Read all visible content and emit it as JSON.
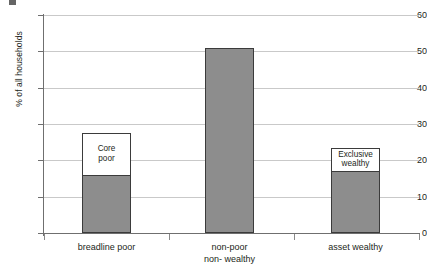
{
  "chart_data": {
    "type": "bar",
    "title": "",
    "subtitle": "",
    "xlabel": "",
    "ylabel": "% of all households",
    "ylim": [
      0,
      60
    ],
    "yticks": [
      0,
      10,
      20,
      30,
      40,
      50,
      60
    ],
    "ytick_labels": [
      "0",
      "10",
      "20",
      "30",
      "40",
      "50",
      "60"
    ],
    "grid": true,
    "legend": "none",
    "categories": [
      "breadline poor",
      "non-poor non- wealthy",
      "asset wealthy"
    ],
    "category_labels": [
      {
        "line1": "breadline poor",
        "line2": ""
      },
      {
        "line1": "non-poor",
        "line2": "non- wealthy"
      },
      {
        "line1": "asset wealthy",
        "line2": ""
      }
    ],
    "series": [
      {
        "name": "shaded portion",
        "values": [
          16,
          51,
          17
        ]
      },
      {
        "name": "total (outlined bar)",
        "values": [
          27.5,
          51,
          23.5
        ]
      }
    ],
    "values": [
      27.5,
      51,
      23.5
    ],
    "annotations": [
      {
        "category": "breadline poor",
        "line1": "Core",
        "line2": "poor",
        "from": 16,
        "to": 27.5
      },
      {
        "category": "asset wealthy",
        "line1": "Exclusive",
        "line2": "wealthy",
        "from": 17,
        "to": 23.5
      }
    ]
  },
  "colors": {
    "bar_fill": "#8d8d8d",
    "bar_outline": "#3b3b3b",
    "gridline": "#c9c9c9",
    "axis": "#6f6f6f",
    "text": "#231f20",
    "background": "#ffffff"
  }
}
